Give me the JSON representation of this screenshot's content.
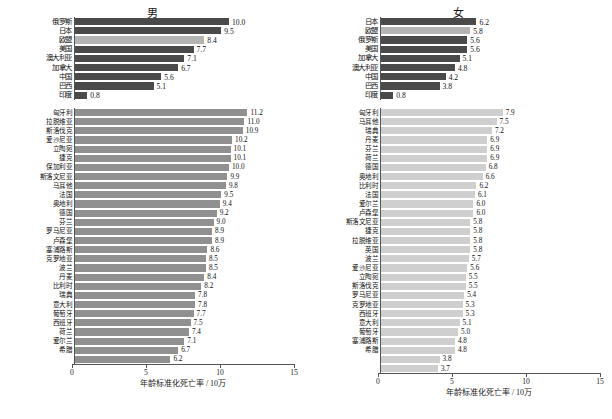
{
  "axis": {
    "title": "年龄标准化死亡率 / 10万",
    "ticks": [
      "0",
      "5",
      "10",
      "15"
    ],
    "min": 0,
    "max": 15
  },
  "panels": [
    {
      "id": "male",
      "title": "男",
      "top": {
        "labels": [
          "俄罗斯",
          "日本",
          "欧盟",
          "美国",
          "澳大利亚",
          "加拿大",
          "中国",
          "巴西",
          "印度"
        ],
        "values": [
          10.0,
          9.5,
          8.4,
          7.7,
          7.1,
          6.7,
          5.6,
          5.1,
          0.8
        ],
        "highlight": 2
      },
      "bottom": {
        "labels": [
          "匈牙利",
          "拉脱维亚",
          "斯洛伐克",
          "爱沙尼亚",
          "立陶宛",
          "捷克",
          "保加利亚",
          "斯洛文尼亚",
          "马耳他",
          "法国",
          "奥地利",
          "德国",
          "芬兰",
          "罗马尼亚",
          "卢森堡",
          "塞浦路斯",
          "克罗地亚",
          "波兰",
          "丹麦",
          "比利时",
          "瑞典",
          "意大利",
          "葡萄牙",
          "西班牙",
          "荷兰",
          "爱尔兰",
          "希腊"
        ],
        "values": [
          11.2,
          11.0,
          10.9,
          10.2,
          10.1,
          10.1,
          10.0,
          9.9,
          9.8,
          9.5,
          9.4,
          9.2,
          9.0,
          8.9,
          8.9,
          8.6,
          8.5,
          8.5,
          8.4,
          8.2,
          7.8,
          7.8,
          7.7,
          7.5,
          7.4,
          7.1,
          6.7,
          6.2
        ]
      }
    },
    {
      "id": "female",
      "title": "女",
      "top": {
        "labels": [
          "日本",
          "欧盟",
          "俄罗斯",
          "美国",
          "加拿大",
          "澳大利亚",
          "中国",
          "巴西",
          "印度"
        ],
        "values": [
          6.2,
          5.8,
          5.6,
          5.6,
          5.1,
          4.8,
          4.2,
          3.8,
          0.8
        ],
        "highlight": 1
      },
      "bottom": {
        "labels": [
          "匈牙利",
          "马耳他",
          "瑞典",
          "丹麦",
          "芬兰",
          "荷兰",
          "德国",
          "奥地利",
          "比利时",
          "法国",
          "爱尔兰",
          "卢森堡",
          "斯洛文尼亚",
          "捷克",
          "拉脱维亚",
          "英国",
          "波兰",
          "爱沙尼亚",
          "立陶宛",
          "斯洛伐克",
          "罗马尼亚",
          "克罗地亚",
          "西班牙",
          "意大利",
          "葡萄牙",
          "塞浦路斯",
          "希腊"
        ],
        "values": [
          7.9,
          7.5,
          7.2,
          6.9,
          6.9,
          6.9,
          6.8,
          6.6,
          6.2,
          6.1,
          6.0,
          6.0,
          5.8,
          5.8,
          5.8,
          5.8,
          5.7,
          5.6,
          5.5,
          5.5,
          5.4,
          5.3,
          5.3,
          5.1,
          5.0,
          4.8,
          4.8,
          3.8,
          3.7
        ]
      }
    }
  ],
  "chart_data": {
    "type": "bar",
    "xlabel": "年龄标准化死亡率 / 10万",
    "ylabel": "",
    "xlim": [
      0,
      15
    ],
    "orientation": "horizontal",
    "grid": false,
    "legend": "none",
    "charts": [
      {
        "panel": "男",
        "subpanel": "国家与地区比较",
        "categories": [
          "俄罗斯",
          "日本",
          "欧盟",
          "美国",
          "澳大利亚",
          "加拿大",
          "中国",
          "巴西",
          "印度"
        ],
        "values": [
          10.0,
          9.5,
          8.4,
          7.7,
          7.1,
          6.7,
          5.6,
          5.1,
          0.8
        ]
      },
      {
        "panel": "男",
        "subpanel": "欧盟成员国",
        "categories": [
          "匈牙利",
          "拉脱维亚",
          "斯洛伐克",
          "爱沙尼亚",
          "立陶宛",
          "捷克",
          "保加利亚",
          "斯洛文尼亚",
          "马耳他",
          "法国",
          "奥地利",
          "德国",
          "芬兰",
          "罗马尼亚",
          "卢森堡",
          "塞浦路斯",
          "克罗地亚",
          "波兰",
          "丹麦",
          "比利时",
          "瑞典",
          "意大利",
          "葡萄牙",
          "西班牙",
          "荷兰",
          "爱尔兰",
          "希腊"
        ],
        "values": [
          11.2,
          11.0,
          10.9,
          10.2,
          10.1,
          10.1,
          10.0,
          9.9,
          9.8,
          9.5,
          9.4,
          9.2,
          9.0,
          8.9,
          8.9,
          8.6,
          8.5,
          8.5,
          8.4,
          8.2,
          7.8,
          7.8,
          7.7,
          7.5,
          7.4,
          7.1,
          6.7,
          6.2
        ]
      },
      {
        "panel": "女",
        "subpanel": "国家与地区比较",
        "categories": [
          "日本",
          "欧盟",
          "俄罗斯",
          "美国",
          "加拿大",
          "澳大利亚",
          "中国",
          "巴西",
          "印度"
        ],
        "values": [
          6.2,
          5.8,
          5.6,
          5.6,
          5.1,
          4.8,
          4.2,
          3.8,
          0.8
        ]
      },
      {
        "panel": "女",
        "subpanel": "欧盟成员国",
        "categories": [
          "匈牙利",
          "马耳他",
          "瑞典",
          "丹麦",
          "芬兰",
          "荷兰",
          "德国",
          "奥地利",
          "比利时",
          "法国",
          "爱尔兰",
          "卢森堡",
          "斯洛文尼亚",
          "捷克",
          "拉脱维亚",
          "英国",
          "波兰",
          "爱沙尼亚",
          "立陶宛",
          "斯洛伐克",
          "罗马尼亚",
          "克罗地亚",
          "西班牙",
          "意大利",
          "葡萄牙",
          "塞浦路斯",
          "希腊"
        ],
        "values": [
          7.9,
          7.5,
          7.2,
          6.9,
          6.9,
          6.9,
          6.8,
          6.6,
          6.2,
          6.1,
          6.0,
          6.0,
          5.8,
          5.8,
          5.8,
          5.8,
          5.7,
          5.6,
          5.5,
          5.5,
          5.4,
          5.3,
          5.3,
          5.1,
          5.0,
          4.8,
          4.8,
          3.8,
          3.7
        ]
      }
    ],
    "colors": {
      "bar_dark": "#4a4a4a",
      "bar_highlight": "#b4b4b4",
      "bar_mid": "#909090",
      "bar_light": "#cfcfcf"
    }
  }
}
